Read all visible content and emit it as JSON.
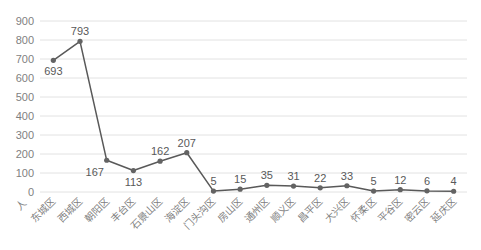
{
  "chart_data": {
    "type": "line",
    "title": "",
    "unit_label": "人",
    "categories": [
      "东城区",
      "西城区",
      "朝阳区",
      "丰台区",
      "石景山区",
      "海淀区",
      "门头沟区",
      "房山区",
      "通州区",
      "顺义区",
      "昌平区",
      "大兴区",
      "怀柔区",
      "平谷区",
      "密云区",
      "延庆区"
    ],
    "values": [
      693,
      793,
      167,
      113,
      162,
      207,
      5,
      15,
      35,
      31,
      22,
      33,
      5,
      12,
      6,
      4
    ],
    "label_positions": [
      "below",
      "above",
      "below-left",
      "below",
      "above",
      "above",
      "above",
      "above",
      "above",
      "above",
      "above",
      "above",
      "above",
      "above",
      "above",
      "above"
    ],
    "yticks": [
      0,
      100,
      200,
      300,
      400,
      500,
      600,
      700,
      800,
      900
    ],
    "ylim": [
      0,
      900
    ],
    "grid": true,
    "legend": "none",
    "x_label_rotation": -45,
    "colors": {
      "line": "#595959",
      "marker": "#636363",
      "grid": "#e2e2e2",
      "axis_text": "#7f7f7f",
      "data_label": "#595959",
      "background": "#ffffff"
    }
  }
}
